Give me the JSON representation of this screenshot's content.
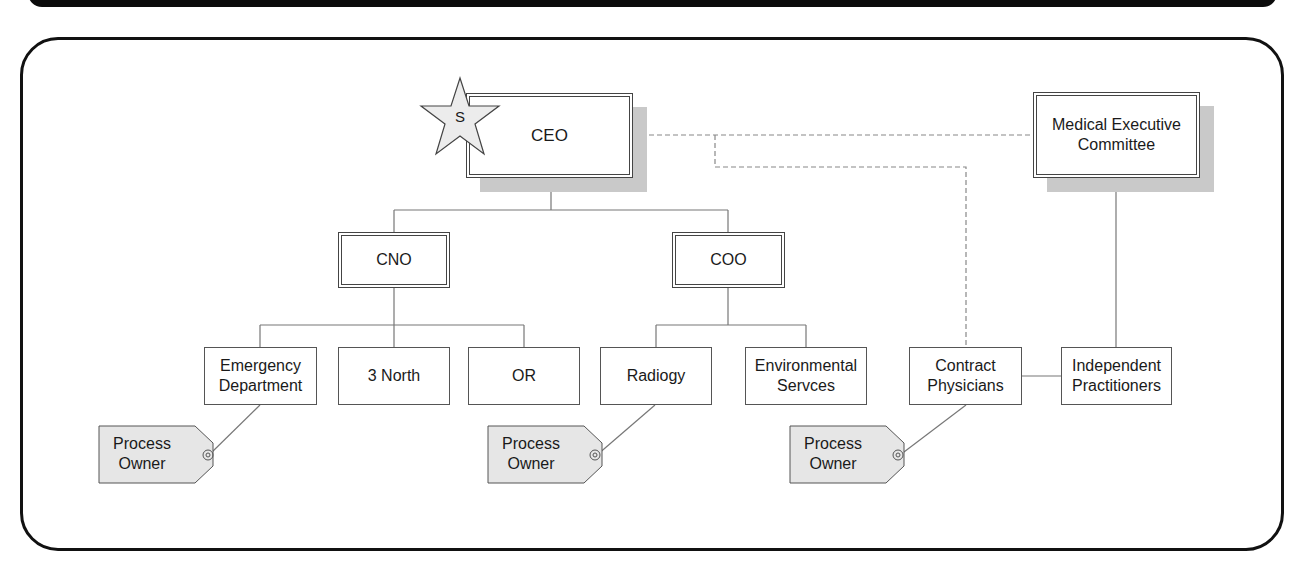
{
  "diagram": {
    "type": "org-chart",
    "nodes": {
      "ceo": {
        "label": "CEO",
        "marker": "S"
      },
      "mec": {
        "label": "Medical Executive Committee"
      },
      "cno": {
        "label": "CNO"
      },
      "coo": {
        "label": "COO"
      },
      "emergency": {
        "label": "Emergency Department"
      },
      "north3": {
        "label": "3 North"
      },
      "or": {
        "label": "OR"
      },
      "radiology": {
        "label": "Radiogy"
      },
      "environmental": {
        "label": "Environmental Servces"
      },
      "contract": {
        "label": "Contract Physicians"
      },
      "independent": {
        "label": "Independent Practitioners"
      }
    },
    "tags": [
      {
        "label": "Process Owner",
        "attached_to": "emergency"
      },
      {
        "label": "Process Owner",
        "attached_to": "radiology"
      },
      {
        "label": "Process Owner",
        "attached_to": "contract"
      }
    ],
    "edges": [
      {
        "from": "ceo",
        "to": "cno",
        "style": "solid"
      },
      {
        "from": "ceo",
        "to": "coo",
        "style": "solid"
      },
      {
        "from": "cno",
        "to": "emergency",
        "style": "solid"
      },
      {
        "from": "cno",
        "to": "north3",
        "style": "solid"
      },
      {
        "from": "cno",
        "to": "or",
        "style": "solid"
      },
      {
        "from": "coo",
        "to": "radiology",
        "style": "solid"
      },
      {
        "from": "coo",
        "to": "environmental",
        "style": "solid"
      },
      {
        "from": "ceo",
        "to": "mec",
        "style": "dashed"
      },
      {
        "from": "ceo",
        "to": "contract",
        "style": "dashed"
      },
      {
        "from": "mec",
        "to": "independent",
        "style": "solid"
      },
      {
        "from": "contract",
        "to": "independent",
        "style": "solid"
      }
    ]
  }
}
